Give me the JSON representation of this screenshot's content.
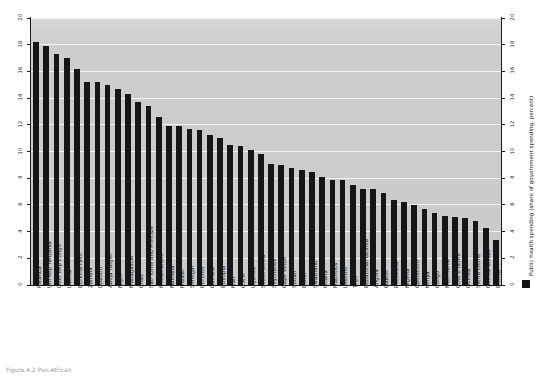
{
  "chart_data": {
    "type": "bar",
    "title": "",
    "xlabel": "",
    "ylabel": "",
    "ylim": [
      0,
      20
    ],
    "grid": true,
    "legend_position": "right",
    "legend": [
      "Public health spending (share of government spending, percent)"
    ],
    "yticks": [
      "0",
      "2",
      "4",
      "6",
      "8",
      "10",
      "12",
      "14",
      "16",
      "18",
      "20"
    ],
    "yticks_right": [
      "0",
      "2",
      "4",
      "6",
      "8",
      "10",
      "12",
      "14",
      "16",
      "18",
      "20"
    ],
    "categories": [
      "Rwanda",
      "Uni Rep Tanzania",
      "Dem Rep Congo",
      "Liberia",
      "Burkina Faso",
      "Zambia",
      "Djibouti",
      "Abuja Target",
      "Niger",
      "Madagascar",
      "Chad",
      "Sao Tome and Principe",
      "Mozambique",
      "Namibia",
      "Malawi",
      "Senegal",
      "Burundi",
      "Gambia",
      "Ethiopia",
      "Mali",
      "C.A.R",
      "Uganda",
      "South Africa",
      "Seychelles",
      "Cape Verde",
      "Sudan",
      "Benin",
      "Swaziland",
      "Ghana",
      "Mauritius",
      "Lesotho",
      "Togo",
      "Equatorial Guinea",
      "Angola",
      "Gabon",
      "Botswana",
      "Nigeria",
      "Cameroon",
      "Kenya",
      "Congo",
      "Mauritania",
      "Cote d'Ivoire",
      "Guinea",
      "Sierra Leone",
      "Guinea-Bissau",
      "Eritrea"
    ],
    "values": [
      18.2,
      17.9,
      17.3,
      17.0,
      16.2,
      15.2,
      15.2,
      15.0,
      14.7,
      14.3,
      13.7,
      13.4,
      12.6,
      11.9,
      11.9,
      11.7,
      11.6,
      11.2,
      11.0,
      10.5,
      10.4,
      10.1,
      9.8,
      9.1,
      9.0,
      8.8,
      8.6,
      8.5,
      8.1,
      7.9,
      7.9,
      7.5,
      7.2,
      7.2,
      6.9,
      6.4,
      6.2,
      6.0,
      5.7,
      5.4,
      5.2,
      5.1,
      5.0,
      4.8,
      4.3,
      3.4
    ],
    "series": [
      {
        "name": "Public health spending (share of government spending, percent)",
        "color": "#161616"
      }
    ]
  },
  "legend": {
    "label": "Public health spending (share of government spending, percent)",
    "swatch_color": "#161616"
  },
  "caption": {
    "text": "Figure 4.2 Pan-African"
  },
  "plot": {
    "background_color": "#cccccc",
    "grid_color": "#f2f2f2",
    "axis_color": "#1a1a1a"
  }
}
